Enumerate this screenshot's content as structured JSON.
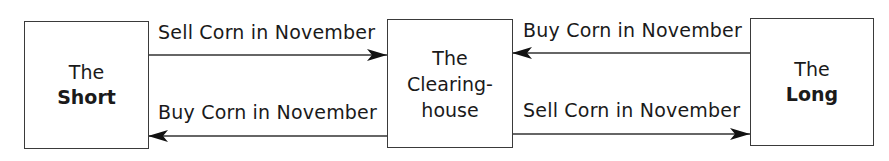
{
  "nodes": {
    "short": {
      "line1": "The",
      "line2": "Short"
    },
    "clearinghouse": {
      "line1": "The",
      "line2": "Clearing-",
      "line3": "house"
    },
    "long": {
      "line1": "The",
      "line2": "Long"
    }
  },
  "edges": [
    {
      "from": "short",
      "to": "clearinghouse",
      "label": "Sell Corn in November"
    },
    {
      "from": "clearinghouse",
      "to": "short",
      "label": "Buy Corn in November"
    },
    {
      "from": "long",
      "to": "clearinghouse",
      "label": "Buy Corn in November"
    },
    {
      "from": "clearinghouse",
      "to": "long",
      "label": "Sell Corn in November"
    }
  ]
}
